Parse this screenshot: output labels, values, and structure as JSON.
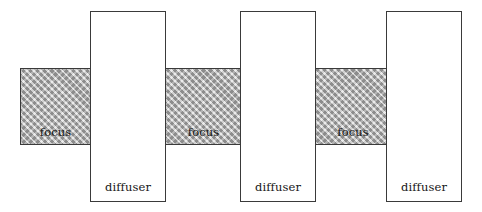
{
  "diagram": {
    "canvas": {
      "width": 482,
      "height": 212,
      "background": "#ffffff"
    },
    "style": {
      "band_fill": "#a8a8a8",
      "band_border": "#3a3a3a",
      "box_fill": "#ffffff",
      "box_border": "#3a3a3a",
      "label_color": "#151515"
    },
    "focus_bands": [
      {
        "label": "focus",
        "x": 20,
        "y": 68,
        "width": 71,
        "height": 77
      },
      {
        "label": "focus",
        "x": 165,
        "y": 68,
        "width": 77,
        "height": 77
      },
      {
        "label": "focus",
        "x": 315,
        "y": 68,
        "width": 76,
        "height": 77
      }
    ],
    "diffuser_boxes": [
      {
        "label": "diffuser",
        "x": 90,
        "y": 11,
        "width": 76,
        "height": 191
      },
      {
        "label": "diffuser",
        "x": 240,
        "y": 11,
        "width": 76,
        "height": 191
      },
      {
        "label": "diffuser",
        "x": 386,
        "y": 11,
        "width": 76,
        "height": 191
      }
    ]
  }
}
